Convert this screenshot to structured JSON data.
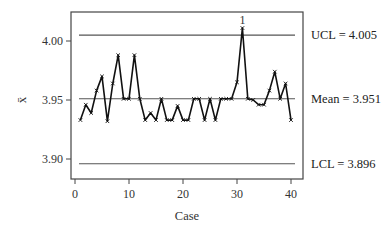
{
  "chart_data": {
    "type": "line",
    "title": "",
    "xlabel": "Case",
    "ylabel": "x̄",
    "xlim": [
      0,
      40
    ],
    "ylim": [
      3.89,
      4.02
    ],
    "x_ticks": [
      0,
      10,
      20,
      30,
      40
    ],
    "y_ticks": [
      3.9,
      3.95,
      4.0
    ],
    "y_tick_labels": [
      "3.90",
      "3.95",
      "4.00"
    ],
    "grid": false,
    "x": [
      1,
      2,
      3,
      4,
      5,
      6,
      7,
      8,
      9,
      10,
      11,
      12,
      13,
      14,
      15,
      16,
      17,
      18,
      19,
      20,
      21,
      22,
      23,
      24,
      25,
      26,
      27,
      28,
      29,
      30,
      31,
      32,
      33,
      34,
      35,
      36,
      37,
      38,
      39,
      40
    ],
    "series": [
      {
        "name": "x̄",
        "values": [
          3.933,
          3.946,
          3.939,
          3.958,
          3.97,
          3.932,
          3.964,
          3.988,
          3.951,
          3.951,
          3.988,
          3.951,
          3.933,
          3.939,
          3.933,
          3.951,
          3.933,
          3.933,
          3.945,
          3.933,
          3.933,
          3.951,
          3.951,
          3.933,
          3.951,
          3.933,
          3.951,
          3.951,
          3.951,
          3.965,
          4.011,
          3.951,
          3.95,
          3.946,
          3.946,
          3.958,
          3.974,
          3.951,
          3.964,
          3.933
        ]
      }
    ],
    "control_limits": {
      "ucl": 4.005,
      "mean": 3.951,
      "lcl": 3.896
    },
    "limit_labels": {
      "ucl": "UCL = 4.005",
      "mean": "Mean = 3.951",
      "lcl": "LCL = 3.896"
    },
    "annotations": [
      {
        "x": 31,
        "text": "1",
        "note": "out-of-control point above UCL"
      }
    ]
  },
  "layout": {
    "frame": {
      "left": 71,
      "top": 12,
      "right": 303,
      "bottom": 179
    },
    "x_map": {
      "origin_px": 75,
      "px_per_unit": 5.4
    },
    "y_map": {
      "ref_value": 3.95,
      "ref_px": 100,
      "px_per_unit": 1180
    },
    "line_span": {
      "x_start": 79,
      "x_end": 295
    },
    "colors": {
      "axis": "#444444",
      "data": "#111111",
      "limit": "#555555"
    }
  }
}
